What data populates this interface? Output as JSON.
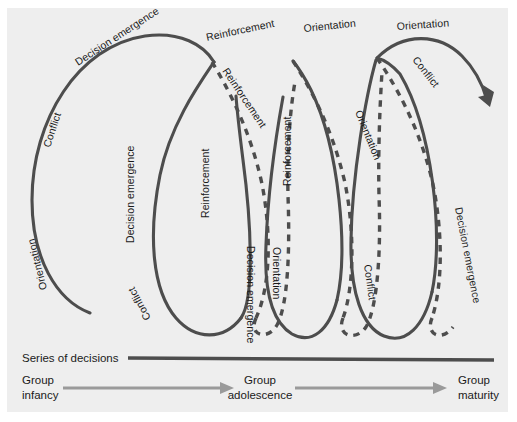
{
  "figure": {
    "panel_background": "#eeeeee",
    "stroke_color": "#4d4d4d",
    "arrow_color": "#9a9a9a"
  },
  "axis": {
    "label": "Series of decisions"
  },
  "stages": [
    {
      "line1": "Group",
      "line2": "infancy"
    },
    {
      "line1": "Group",
      "line2": "adolescence"
    },
    {
      "line1": "Group",
      "line2": "maturity"
    }
  ],
  "spirals": [
    {
      "name": "loop-1",
      "style": "solid",
      "labels": [
        "Orientation",
        "Conflict",
        "Decision emergence"
      ]
    },
    {
      "name": "loop-2",
      "style": "solid",
      "labels": [
        "Decision emergence",
        "Conflict",
        "Reinforcement"
      ]
    },
    {
      "name": "loop-3",
      "style": "dashed",
      "labels": [
        "Reinforcement",
        "Reinforcement",
        "Orientation"
      ]
    },
    {
      "name": "loop-4",
      "style": "solid",
      "labels": [
        "Reinforcement",
        "Decision emergence",
        "Orientation"
      ]
    },
    {
      "name": "loop-5",
      "style": "dashed",
      "labels": [
        "Orientation",
        "Orientation",
        "Conflict"
      ]
    },
    {
      "name": "loop-6",
      "style": "solid",
      "labels": [
        "Orientation",
        "Conflict",
        "Decision emergence"
      ]
    }
  ],
  "curve_labels": [
    {
      "id": "lbl-orientation-1",
      "text": "Orientation",
      "x": 47,
      "y": 289,
      "rotate": -104
    },
    {
      "id": "lbl-conflict-1",
      "text": "Conflict",
      "x": 50,
      "y": 148,
      "rotate": -72
    },
    {
      "id": "lbl-decision-emergence-1",
      "text": "Decision emergence",
      "x": 78,
      "y": 66,
      "rotate": -33
    },
    {
      "id": "lbl-decision-emergence-2",
      "text": "Decision emergence",
      "x": 134,
      "y": 243,
      "rotate": -90
    },
    {
      "id": "lbl-conflict-2",
      "text": "Conflict",
      "x": 151,
      "y": 318,
      "rotate": -118
    },
    {
      "id": "lbl-reinforcement-1",
      "text": "Reinforcement",
      "x": 207,
      "y": 41,
      "rotate": -12
    },
    {
      "id": "lbl-reinforcement-2",
      "text": "Reinforcement",
      "x": 222,
      "y": 71,
      "rotate": 56
    },
    {
      "id": "lbl-reinforcement-3",
      "text": "Reinforcement",
      "x": 209,
      "y": 218,
      "rotate": -90
    },
    {
      "id": "lbl-decision-emergence-3",
      "text": "Decision emergence",
      "x": 247,
      "y": 246,
      "rotate": 90
    },
    {
      "id": "lbl-orientation-2",
      "text": "Orientation",
      "x": 273,
      "y": 247,
      "rotate": 90
    },
    {
      "id": "lbl-reinforcement-4",
      "text": "Reinforcement",
      "x": 291,
      "y": 186,
      "rotate": -90
    },
    {
      "id": "lbl-orientation-3",
      "text": "Orientation",
      "x": 304,
      "y": 32,
      "rotate": -6
    },
    {
      "id": "lbl-orientation-4",
      "text": "Orientation",
      "x": 355,
      "y": 112,
      "rotate": 68
    },
    {
      "id": "lbl-conflict-3",
      "text": "Conflict",
      "x": 364,
      "y": 265,
      "rotate": 82
    },
    {
      "id": "lbl-orientation-5",
      "text": "Orientation",
      "x": 397,
      "y": 30,
      "rotate": -4
    },
    {
      "id": "lbl-conflict-4",
      "text": "Conflict",
      "x": 412,
      "y": 60,
      "rotate": 52
    },
    {
      "id": "lbl-decision-emergence-4",
      "text": "Decision emergence",
      "x": 455,
      "y": 208,
      "rotate": 79
    }
  ]
}
